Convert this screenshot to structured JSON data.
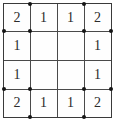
{
  "puzzle": {
    "type": "slitherlink-grid",
    "rows": 4,
    "cols": 4,
    "colors": {
      "border": "#3a3a3a",
      "gridline": "#4a4a4a",
      "dot": "#151515",
      "number": "#2b2b2b",
      "background": "#ffffff"
    },
    "cells": [
      {
        "id": "r0c0",
        "row": 0,
        "col": 0,
        "value": "2",
        "dots": [
          "br"
        ]
      },
      {
        "id": "r0c1",
        "row": 0,
        "col": 1,
        "value": "1",
        "dots": [
          "tl"
        ]
      },
      {
        "id": "r0c2",
        "row": 0,
        "col": 2,
        "value": "1",
        "dots": [
          "tr"
        ]
      },
      {
        "id": "r0c3",
        "row": 0,
        "col": 3,
        "value": "2",
        "dots": [
          "bl"
        ]
      },
      {
        "id": "r1c0",
        "row": 1,
        "col": 0,
        "value": "1",
        "dots": [
          "tl"
        ]
      },
      {
        "id": "r1c1",
        "row": 1,
        "col": 1,
        "value": "",
        "dots": []
      },
      {
        "id": "r1c2",
        "row": 1,
        "col": 2,
        "value": "",
        "dots": []
      },
      {
        "id": "r1c3",
        "row": 1,
        "col": 3,
        "value": "1",
        "dots": [
          "tr"
        ]
      },
      {
        "id": "r2c0",
        "row": 2,
        "col": 0,
        "value": "1",
        "dots": [
          "bl"
        ]
      },
      {
        "id": "r2c1",
        "row": 2,
        "col": 1,
        "value": "",
        "dots": []
      },
      {
        "id": "r2c2",
        "row": 2,
        "col": 2,
        "value": "",
        "dots": []
      },
      {
        "id": "r2c3",
        "row": 2,
        "col": 3,
        "value": "1",
        "dots": [
          "br"
        ]
      },
      {
        "id": "r3c0",
        "row": 3,
        "col": 0,
        "value": "2",
        "dots": [
          "tr"
        ]
      },
      {
        "id": "r3c1",
        "row": 3,
        "col": 1,
        "value": "1",
        "dots": [
          "bl"
        ]
      },
      {
        "id": "r3c2",
        "row": 3,
        "col": 2,
        "value": "1",
        "dots": [
          "br"
        ]
      },
      {
        "id": "r3c3",
        "row": 3,
        "col": 3,
        "value": "2",
        "dots": [
          "tl"
        ]
      }
    ],
    "center_region": {
      "label": "",
      "rows": [
        1,
        2
      ],
      "cols": [
        1,
        2
      ]
    }
  }
}
